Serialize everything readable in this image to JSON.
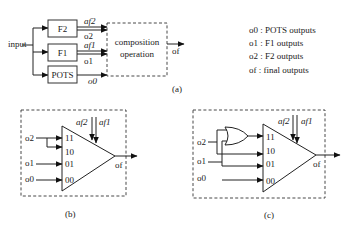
{
  "panel_a": {
    "input_label": "input",
    "blocks": [
      {
        "id": "F2",
        "label": "F2"
      },
      {
        "id": "F1",
        "label": "F1"
      },
      {
        "id": "POTS",
        "label": "POTS"
      }
    ],
    "signals": {
      "af2": "af2",
      "o2": "o2",
      "af1": "af1",
      "o1": "o1",
      "o0": "o0"
    },
    "composition_line1": "composition",
    "composition_line2": "operation",
    "output_label": "of",
    "caption": "(a)"
  },
  "legend": {
    "items": [
      "o0 : POTS outputs",
      "o1 : F1 outputs",
      "o2 : F2 outputs",
      "of : final outputs"
    ]
  },
  "panel_b": {
    "inputs": {
      "o2": "o2",
      "o1": "o1",
      "o0": "o0"
    },
    "mux_ports": [
      "11",
      "10",
      "01",
      "00"
    ],
    "selects": {
      "af2": "af2",
      "af1": "af1"
    },
    "output_label": "of",
    "caption": "(b)"
  },
  "panel_c": {
    "inputs": {
      "o2": "o2",
      "o1": "o1",
      "o0": "o0"
    },
    "mux_ports": [
      "11",
      "10",
      "01",
      "00"
    ],
    "selects": {
      "af2": "af2",
      "af1": "af1"
    },
    "output_label": "of",
    "gate": "OR",
    "caption": "(c)"
  }
}
